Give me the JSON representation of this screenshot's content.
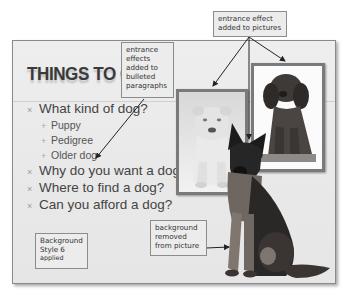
{
  "slide": {
    "title": "THINGS TO CONSIDER",
    "title_visible": "THINGS TO CO",
    "bullets": [
      {
        "level": 1,
        "text": "What kind of dog?"
      },
      {
        "level": 2,
        "text": "Puppy"
      },
      {
        "level": 2,
        "text": "Pedigree"
      },
      {
        "level": 2,
        "text": "Older dog"
      },
      {
        "level": 1,
        "text": "Why do you want a dog?"
      },
      {
        "level": 1,
        "text": "Where to find a dog?"
      },
      {
        "level": 1,
        "text": "Can you afford a dog?"
      }
    ],
    "bullet_marks": {
      "level1": "×",
      "level2": "+"
    },
    "pictures": [
      {
        "name": "white-puppy-picture",
        "description": "white shar-pei puppy in framed picture"
      },
      {
        "name": "brown-puppy-picture",
        "description": "cocker spaniel puppy in framed picture"
      },
      {
        "name": "german-shepherd-picture",
        "description": "german shepherd with background removed"
      }
    ]
  },
  "callouts": {
    "pictures_effect": "entrance effect added to pictures",
    "pictures_effect_lines": [
      "entrance effect",
      "added to pictures"
    ],
    "bullets_effect_lines": [
      "entrance",
      "effects",
      "added to",
      "bulleted",
      "paragraphs"
    ],
    "background_style_lines": [
      "Background",
      "Style 6",
      "applied"
    ],
    "background_removed_lines": [
      "background",
      "removed",
      "from picture"
    ]
  },
  "colors": {
    "slide_bg": "#eaeaea",
    "frame": "#7a7a7a",
    "title": "#3a3a3a",
    "text": "#444444",
    "callout_bg": "#ececec",
    "callout_border": "#8c8c8c",
    "arrow": "#222222"
  }
}
